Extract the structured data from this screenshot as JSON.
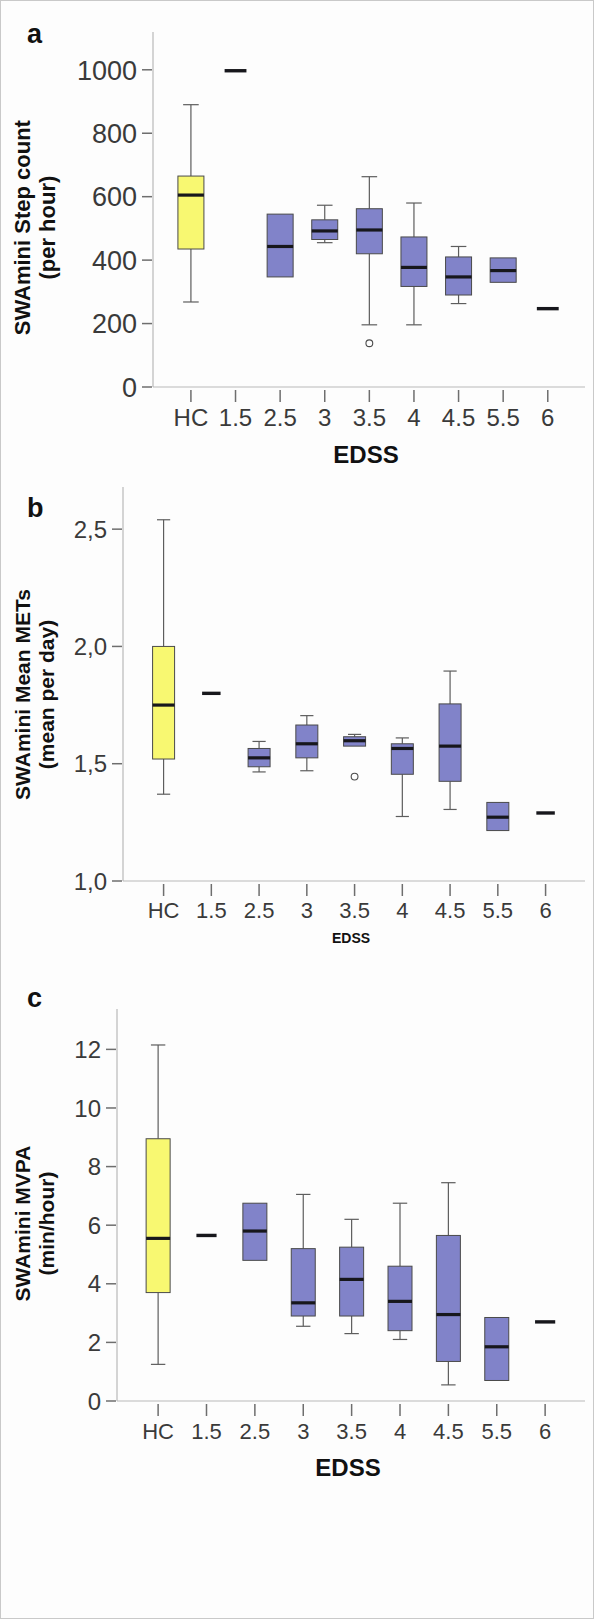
{
  "figure": {
    "background": "#fdfdfd",
    "border_color": "#c9c9c9",
    "hc_color": "#f8f871",
    "ms_color": "#8183c9",
    "box_edge_color": "#4a4a4a",
    "median_color": "#17171c",
    "axis_color": "#b9b9b9"
  },
  "panels": [
    {
      "letter": "a",
      "ylabel_line1": "SWAmini Step count",
      "ylabel_line2": "(per hour)",
      "xlabel": "EDSS",
      "chart_data": {
        "type": "box",
        "title": "SWAmini Step count (per hour) by EDSS",
        "xlabel": "EDSS",
        "ylabel": "SWAmini Step count (per hour)",
        "ylim": [
          0,
          1075
        ],
        "yticks": [
          0,
          200,
          400,
          600,
          800,
          1000
        ],
        "ytick_labels": [
          "0",
          "200",
          "400",
          "600",
          "800",
          "1000"
        ],
        "grid": false,
        "legend": null,
        "categories": [
          "HC",
          "1.5",
          "2.5",
          "3",
          "3.5",
          "4",
          "4.5",
          "5.5",
          "6"
        ],
        "boxes": [
          {
            "category": "HC",
            "group": "HC",
            "whisker_low": 268,
            "q1": 435,
            "median": 605,
            "q3": 665,
            "whisker_high": 890,
            "outliers": [],
            "single_value": null
          },
          {
            "category": "1.5",
            "group": "MS",
            "whisker_low": null,
            "q1": null,
            "median": null,
            "q3": null,
            "whisker_high": null,
            "outliers": [],
            "single_value": 997
          },
          {
            "category": "2.5",
            "group": "MS",
            "whisker_low": null,
            "q1": 347,
            "median": 443,
            "q3": 545,
            "whisker_high": null,
            "outliers": [],
            "single_value": null
          },
          {
            "category": "3",
            "group": "MS",
            "whisker_low": 455,
            "q1": 465,
            "median": 492,
            "q3": 527,
            "whisker_high": 573,
            "outliers": [],
            "single_value": null
          },
          {
            "category": "3.5",
            "group": "MS",
            "whisker_low": 196,
            "q1": 420,
            "median": 495,
            "q3": 562,
            "whisker_high": 663,
            "outliers": [
              138
            ],
            "single_value": null
          },
          {
            "category": "4",
            "group": "MS",
            "whisker_low": 196,
            "q1": 317,
            "median": 377,
            "q3": 473,
            "whisker_high": 580,
            "outliers": [],
            "single_value": null
          },
          {
            "category": "4.5",
            "group": "MS",
            "whisker_low": 263,
            "q1": 290,
            "median": 347,
            "q3": 410,
            "whisker_high": 443,
            "outliers": [],
            "single_value": null
          },
          {
            "category": "5.5",
            "group": "MS",
            "whisker_low": null,
            "q1": 330,
            "median": 367,
            "q3": 407,
            "whisker_high": null,
            "outliers": [],
            "single_value": null
          },
          {
            "category": "6",
            "group": "MS",
            "whisker_low": null,
            "q1": null,
            "median": null,
            "q3": null,
            "whisker_high": null,
            "outliers": [],
            "single_value": 247
          }
        ]
      }
    },
    {
      "letter": "b",
      "ylabel_line1": "SWAmini Mean METs",
      "ylabel_line2": "(mean per day)",
      "xlabel": "EDSS",
      "chart_data": {
        "type": "box",
        "title": "SWAmini Mean METs (mean per day) by EDSS",
        "xlabel": "EDSS",
        "ylabel": "SWAmini Mean METs (mean per day)",
        "ylim": [
          1.0,
          2.62
        ],
        "yticks": [
          1.0,
          1.5,
          2.0,
          2.5
        ],
        "ytick_labels": [
          "1,0",
          "1,5",
          "2,0",
          "2,5"
        ],
        "grid": false,
        "legend": null,
        "categories": [
          "HC",
          "1.5",
          "2.5",
          "3",
          "3.5",
          "4",
          "4.5",
          "5.5",
          "6"
        ],
        "boxes": [
          {
            "category": "HC",
            "group": "HC",
            "whisker_low": 1.37,
            "q1": 1.52,
            "median": 1.75,
            "q3": 2.0,
            "whisker_high": 2.54,
            "outliers": [],
            "single_value": null
          },
          {
            "category": "1.5",
            "group": "MS",
            "whisker_low": null,
            "q1": null,
            "median": null,
            "q3": null,
            "whisker_high": null,
            "outliers": [],
            "single_value": 1.8
          },
          {
            "category": "2.5",
            "group": "MS",
            "whisker_low": 1.465,
            "q1": 1.487,
            "median": 1.525,
            "q3": 1.565,
            "whisker_high": 1.595,
            "outliers": [],
            "single_value": null
          },
          {
            "category": "3",
            "group": "MS",
            "whisker_low": 1.47,
            "q1": 1.525,
            "median": 1.585,
            "q3": 1.665,
            "whisker_high": 1.705,
            "outliers": [],
            "single_value": null
          },
          {
            "category": "3.5",
            "group": "MS",
            "whisker_low": null,
            "q1": 1.575,
            "median": 1.598,
            "q3": 1.615,
            "whisker_high": 1.625,
            "outliers": [
              1.445
            ],
            "single_value": null
          },
          {
            "category": "4",
            "group": "MS",
            "whisker_low": 1.275,
            "q1": 1.455,
            "median": 1.565,
            "q3": 1.585,
            "whisker_high": 1.61,
            "outliers": [],
            "single_value": null
          },
          {
            "category": "4.5",
            "group": "MS",
            "whisker_low": 1.305,
            "q1": 1.425,
            "median": 1.575,
            "q3": 1.755,
            "whisker_high": 1.895,
            "outliers": [],
            "single_value": null
          },
          {
            "category": "5.5",
            "group": "MS",
            "whisker_low": null,
            "q1": 1.215,
            "median": 1.272,
            "q3": 1.335,
            "whisker_high": null,
            "outliers": [],
            "single_value": null
          },
          {
            "category": "6",
            "group": "MS",
            "whisker_low": null,
            "q1": null,
            "median": null,
            "q3": null,
            "whisker_high": null,
            "outliers": [],
            "single_value": 1.29
          }
        ]
      }
    },
    {
      "letter": "c",
      "ylabel_line1": "SWAmini MVPA",
      "ylabel_line2": "(min/hour)",
      "xlabel": "EDSS",
      "chart_data": {
        "type": "box",
        "title": "SWAmini MVPA (min/hour) by EDSS",
        "xlabel": "EDSS",
        "ylabel": "SWAmini MVPA (min/hour)",
        "ylim": [
          0,
          12.9
        ],
        "yticks": [
          0,
          2,
          4,
          6,
          8,
          10,
          12
        ],
        "ytick_labels": [
          "0",
          "2",
          "4",
          "6",
          "8",
          "10",
          "12"
        ],
        "grid": false,
        "legend": null,
        "categories": [
          "HC",
          "1.5",
          "2.5",
          "3",
          "3.5",
          "4",
          "4.5",
          "5.5",
          "6"
        ],
        "boxes": [
          {
            "category": "HC",
            "group": "HC",
            "whisker_low": 1.25,
            "q1": 3.7,
            "median": 5.55,
            "q3": 8.95,
            "whisker_high": 12.15,
            "outliers": [],
            "single_value": null
          },
          {
            "category": "1.5",
            "group": "MS",
            "whisker_low": null,
            "q1": null,
            "median": null,
            "q3": null,
            "whisker_high": null,
            "outliers": [],
            "single_value": 5.65
          },
          {
            "category": "2.5",
            "group": "MS",
            "whisker_low": null,
            "q1": 4.8,
            "median": 5.8,
            "q3": 6.75,
            "whisker_high": null,
            "outliers": [],
            "single_value": null
          },
          {
            "category": "3",
            "group": "MS",
            "whisker_low": 2.55,
            "q1": 2.9,
            "median": 3.35,
            "q3": 5.2,
            "whisker_high": 7.05,
            "outliers": [],
            "single_value": null
          },
          {
            "category": "3.5",
            "group": "MS",
            "whisker_low": 2.3,
            "q1": 2.9,
            "median": 4.15,
            "q3": 5.25,
            "whisker_high": 6.2,
            "outliers": [],
            "single_value": null
          },
          {
            "category": "4",
            "group": "MS",
            "whisker_low": 2.1,
            "q1": 2.4,
            "median": 3.4,
            "q3": 4.6,
            "whisker_high": 6.75,
            "outliers": [],
            "single_value": null
          },
          {
            "category": "4.5",
            "group": "MS",
            "whisker_low": 0.55,
            "q1": 1.35,
            "median": 2.95,
            "q3": 5.65,
            "whisker_high": 7.45,
            "outliers": [],
            "single_value": null
          },
          {
            "category": "5.5",
            "group": "MS",
            "whisker_low": null,
            "q1": 0.7,
            "median": 1.85,
            "q3": 2.85,
            "whisker_high": null,
            "outliers": [],
            "single_value": null
          },
          {
            "category": "6",
            "group": "MS",
            "whisker_low": null,
            "q1": null,
            "median": null,
            "q3": null,
            "whisker_high": null,
            "outliers": [],
            "single_value": 2.7
          }
        ]
      }
    }
  ]
}
